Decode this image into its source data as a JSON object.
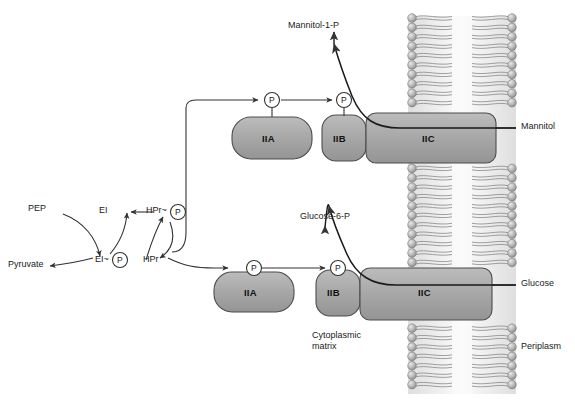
{
  "figure": {
    "background": "#ffffff",
    "line_color": "#333333",
    "protein_fill": "#a8a8a8",
    "protein_stroke": "#4d4d4d",
    "membrane_head_color": "#b3b3b3",
    "membrane_tail_color": "#8c8c8c",
    "membrane_core_color": "#f2f2f2"
  },
  "phosphorelay": {
    "pep": "PEP",
    "pyruvate": "Pyruvate",
    "ei": "EI",
    "ei_p": "EI",
    "ei_p_tilde": "~",
    "hpr": "HPr",
    "hpr_p": "HPr",
    "hpr_p_tilde": "~",
    "phosphate_glyph": "P"
  },
  "mannitol_system": {
    "substrate_out": "Mannitol",
    "product_in": "Mannitol-1-P",
    "proteins": [
      {
        "id": "iia",
        "label": "IIA"
      },
      {
        "id": "iib",
        "label": "IIB"
      },
      {
        "id": "iic",
        "label": "IIC"
      }
    ],
    "phosphate_markers": [
      "P",
      "P"
    ]
  },
  "glucose_system": {
    "substrate_out": "Glucose",
    "product_in": "Glucose-6-P",
    "proteins": [
      {
        "id": "iia",
        "label": "IIA"
      },
      {
        "id": "iib",
        "label": "IIB"
      },
      {
        "id": "iic",
        "label": "IIC"
      }
    ],
    "phosphate_markers": [
      "P",
      "P"
    ]
  },
  "compartments": {
    "cytoplasm_line1": "Cytoplasmic",
    "cytoplasm_line2": "matrix",
    "periplasm": "Periplasm"
  }
}
